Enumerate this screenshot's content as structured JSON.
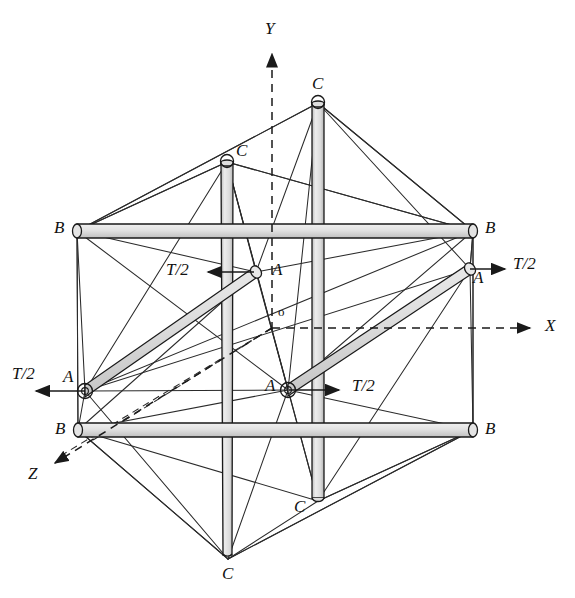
{
  "figure": {
    "type": "engineering-diagram",
    "width": 575,
    "height": 598,
    "background": "#ffffff",
    "stroke_color": "#1a1a1a",
    "rod_fill": "#e3e3e3",
    "rod_fill_dark": "#c9c9c9",
    "cable_color": "#333333",
    "axis_style": "dashed"
  },
  "axes": [
    {
      "name": "y-axis",
      "label": "Y",
      "x1": 272,
      "y1": 330,
      "x2": 272,
      "y2": 48,
      "lx": 265,
      "ly": 20,
      "dashed": true
    },
    {
      "name": "x-axis",
      "label": "X",
      "x1": 272,
      "y1": 328,
      "x2": 536,
      "y2": 328,
      "lx": 545,
      "ly": 317,
      "dashed": true
    },
    {
      "name": "z-axis",
      "label": "Z",
      "x1": 272,
      "y1": 328,
      "x2": 49,
      "y2": 466,
      "lx": 28,
      "ly": 465,
      "dashed": true
    }
  ],
  "origin": {
    "name": "origin",
    "label": "o",
    "lx": 278,
    "ly": 305
  },
  "nodes": [
    {
      "id": "C-top",
      "label": "C",
      "x": 318,
      "y": 103,
      "lx": 312,
      "ly": 75
    },
    {
      "id": "C-upper-left",
      "label": "C",
      "x": 227,
      "y": 162,
      "lx": 236,
      "ly": 142
    },
    {
      "id": "C-lower-mid",
      "label": "C",
      "x": 318,
      "y": 501,
      "lx": 294,
      "ly": 498
    },
    {
      "id": "C-bottom",
      "label": "C",
      "x": 228,
      "y": 559,
      "lx": 222,
      "ly": 565
    },
    {
      "id": "B-upper-left",
      "label": "B",
      "x": 77,
      "y": 231,
      "lx": 54,
      "ly": 219
    },
    {
      "id": "B-upper-right",
      "label": "B",
      "x": 473,
      "y": 231,
      "lx": 485,
      "ly": 219
    },
    {
      "id": "B-lower-left",
      "label": "B",
      "x": 78,
      "y": 430,
      "lx": 55,
      "ly": 420
    },
    {
      "id": "B-lower-right",
      "label": "B",
      "x": 473,
      "y": 430,
      "lx": 485,
      "ly": 420
    },
    {
      "id": "A-upper-mid",
      "label": "A",
      "x": 256,
      "y": 272,
      "lx": 272,
      "ly": 261
    },
    {
      "id": "A-upper-right",
      "label": "A",
      "x": 470,
      "y": 269,
      "lx": 473,
      "ly": 269
    },
    {
      "id": "A-lower-left",
      "label": "A",
      "x": 85,
      "y": 391,
      "lx": 63,
      "ly": 368
    },
    {
      "id": "A-lower-mid",
      "label": "A",
      "x": 288,
      "y": 390,
      "lx": 265,
      "ly": 377
    }
  ],
  "forces": [
    {
      "id": "force-upper-left",
      "label": "T/2",
      "lx": 166,
      "ly": 261,
      "x1": 254,
      "y1": 272,
      "x2": 203,
      "y2": 272,
      "dir": "left"
    },
    {
      "id": "force-upper-right",
      "label": "T/2",
      "lx": 513,
      "ly": 255,
      "x1": 470,
      "y1": 269,
      "x2": 508,
      "y2": 269,
      "dir": "right"
    },
    {
      "id": "force-lower-left",
      "label": "T/2",
      "lx": 12,
      "ly": 365,
      "x1": 85,
      "y1": 391,
      "x2": 31,
      "y2": 391,
      "dir": "left"
    },
    {
      "id": "force-lower-mid",
      "label": "T/2",
      "lx": 352,
      "ly": 377,
      "x1": 289,
      "y1": 390,
      "x2": 342,
      "y2": 390,
      "dir": "right"
    }
  ],
  "struts": [
    {
      "id": "strut-A-left",
      "label": "A",
      "from": "A-lower-left",
      "to": "A-upper-mid"
    },
    {
      "id": "strut-A-right",
      "label": "A",
      "from": "A-lower-mid",
      "to": "A-upper-right"
    },
    {
      "id": "strut-B-upper",
      "label": "B",
      "from": "B-upper-left",
      "to": "B-upper-right"
    },
    {
      "id": "strut-B-lower",
      "label": "B",
      "from": "B-lower-left",
      "to": "B-lower-right"
    },
    {
      "id": "strut-C-left",
      "label": "C",
      "from": "C-upper-left",
      "to": "C-bottom"
    },
    {
      "id": "strut-C-right",
      "label": "C",
      "from": "C-top",
      "to": "C-lower-mid"
    }
  ]
}
